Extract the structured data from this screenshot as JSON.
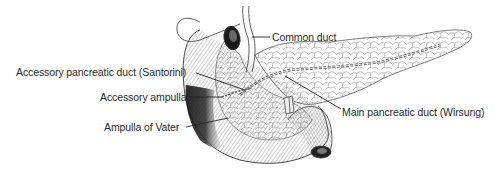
{
  "diagram": {
    "colors": {
      "ink": "#2a2a2a",
      "background": "#ffffff",
      "dark_shading": "#1a1a1a"
    },
    "labels": [
      {
        "id": "common-duct",
        "text": "Common duct",
        "x": 272,
        "y": 31
      },
      {
        "id": "santorini",
        "text": "Accessory pancreatic duct (Santorini)",
        "x": 16,
        "y": 66
      },
      {
        "id": "accessory-ampulla",
        "text": "Accessory ampulla",
        "x": 100,
        "y": 91
      },
      {
        "id": "ampulla-of-vater",
        "text": "Ampulla of Vater",
        "x": 104,
        "y": 121
      },
      {
        "id": "wirsung",
        "text": "Main pancreatic duct (Wirsung)",
        "x": 342,
        "y": 106
      }
    ]
  }
}
